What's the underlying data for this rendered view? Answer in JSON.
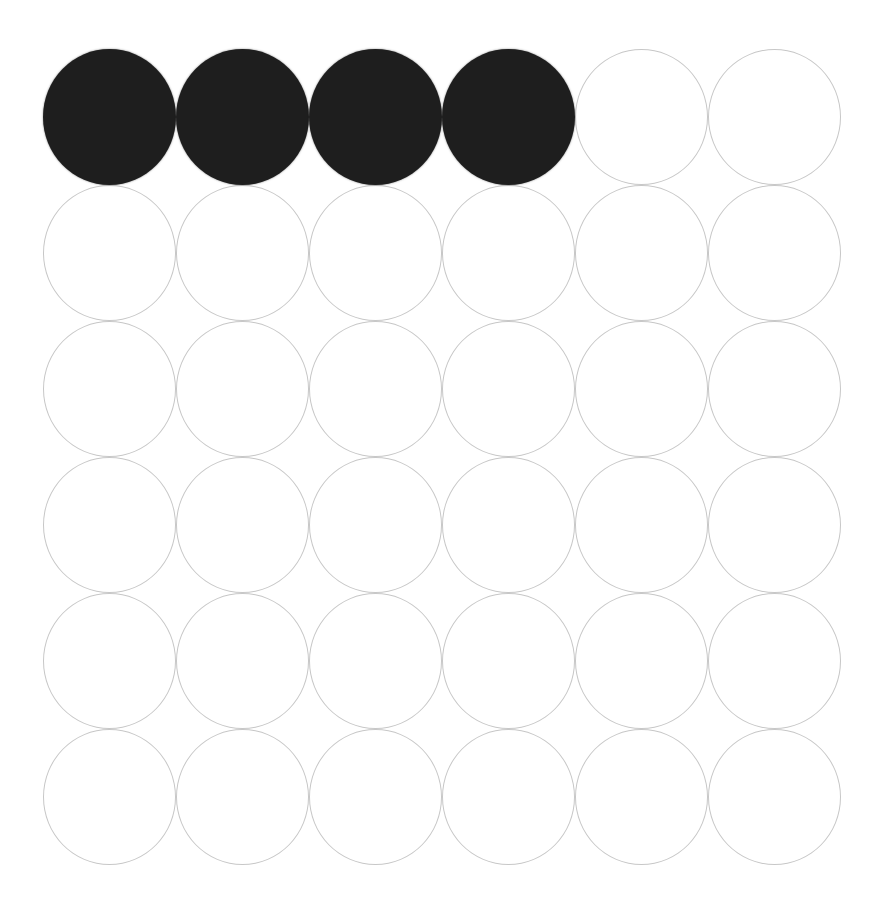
{
  "figure": {
    "rows": 6,
    "columns": 6,
    "total_circles": 36,
    "filled_circles": 4,
    "empty_circles": 32,
    "colors": {
      "background": "#ffffff",
      "fill": "#1e1e1e",
      "outline": "#c7c7c7"
    },
    "grid": [
      [
        "filled",
        "filled",
        "filled",
        "filled",
        "empty",
        "empty"
      ],
      [
        "empty",
        "empty",
        "empty",
        "empty",
        "empty",
        "empty"
      ],
      [
        "empty",
        "empty",
        "empty",
        "empty",
        "empty",
        "empty"
      ],
      [
        "empty",
        "empty",
        "empty",
        "empty",
        "empty",
        "empty"
      ],
      [
        "empty",
        "empty",
        "empty",
        "empty",
        "empty",
        "empty"
      ],
      [
        "empty",
        "empty",
        "empty",
        "empty",
        "empty",
        "empty"
      ]
    ]
  }
}
